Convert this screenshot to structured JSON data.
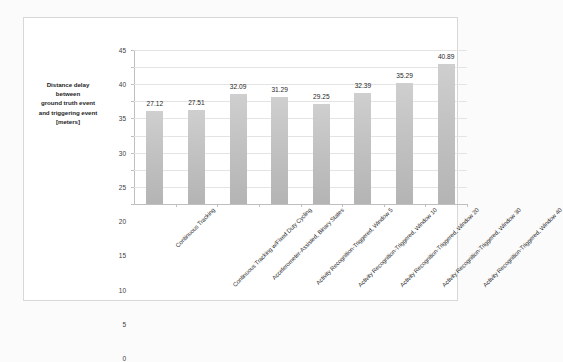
{
  "chart_data": {
    "type": "bar",
    "title": "",
    "xlabel": "",
    "ylabel": "Distance delay between ground truth event and triggering event [meters]",
    "ylim": [
      0,
      45
    ],
    "ytick_step": 5,
    "yticks": [
      "45",
      "40",
      "35",
      "30",
      "25",
      "20",
      "15",
      "10",
      "5",
      "0"
    ],
    "grid": true,
    "legend": "none",
    "bar_color": "#c2c2c2",
    "categories": [
      "Continuous Tracking",
      "Continuous Tracking w/Fixed Duty Cycling",
      "Accelerometer-Assisted, Binary States",
      "Activity Recognition-Triggered, Window 5",
      "Activity Recognition-Triggered, Window 10",
      "Activity Recognition-Triggered, Window 20",
      "Activity Recognition-Triggered, Window 30",
      "Activity Recognition-Triggered, Window 40"
    ],
    "values": [
      27.12,
      27.51,
      32.09,
      31.29,
      29.25,
      32.39,
      35.29,
      40.89
    ],
    "value_labels": [
      "27.12",
      "27.51",
      "32.09",
      "31.29",
      "29.25",
      "32.39",
      "35.29",
      "40.89"
    ]
  },
  "axis_title_lines": [
    "Distance delay",
    "between",
    "ground truth event",
    "and triggering event",
    "[meters]"
  ]
}
